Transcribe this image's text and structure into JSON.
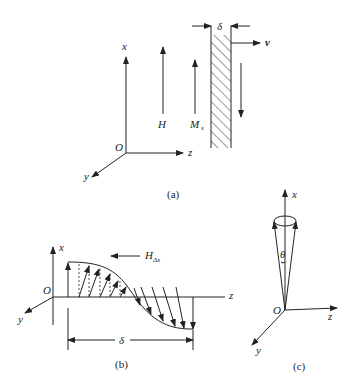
{
  "figure_a": {
    "caption": "(a)",
    "axes": {
      "x": "x",
      "z": "z",
      "y": "y",
      "origin": "O"
    },
    "field_label": "H",
    "magnetization_label": "M",
    "magnetization_sub": "s",
    "thickness_label": "δ",
    "velocity_label": "v"
  },
  "figure_b": {
    "caption": "(b)",
    "axes": {
      "x": "x",
      "z": "z",
      "y": "y",
      "origin": "O"
    },
    "field_label": "H",
    "field_sub": "Δx",
    "width_label": "δ"
  },
  "figure_c": {
    "caption": "(c)",
    "axes": {
      "x": "x",
      "z": "z",
      "y": "y",
      "origin": "O"
    },
    "angle_label": "θ"
  }
}
